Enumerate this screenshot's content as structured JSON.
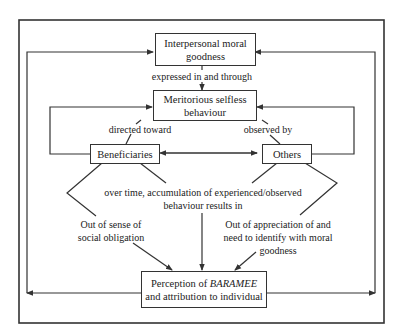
{
  "diagram": {
    "nodes": {
      "moral_goodness": "Interpersonal moral goodness",
      "behaviour": "Meritorious selfless behaviour",
      "beneficiaries": "Beneficiaries",
      "others": "Others",
      "perception_prefix": "Perception of ",
      "perception_term": "BARAMEE",
      "perception_suffix": "and attribution to individual"
    },
    "edge_labels": {
      "expressed": "expressed in and through",
      "directed": "directed toward",
      "observed": "observed by",
      "accumulation": "over time, accumulation of experienced/observed behaviour results in",
      "obligation": "Out of sense of social obligation",
      "appreciation": "Out of appreciation of and need to identify with moral goodness"
    },
    "colors": {
      "line": "#333333",
      "background": "#ffffff"
    }
  }
}
